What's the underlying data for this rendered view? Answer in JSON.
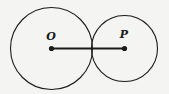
{
  "diagram": {
    "background": "#f4f4f2",
    "stroke_color": "#1a1a1a",
    "circles": [
      {
        "name": "circle-O",
        "cx": 51.5,
        "cy": 48.5,
        "r": 41
      },
      {
        "name": "circle-P",
        "cx": 124.5,
        "cy": 48.5,
        "r": 33
      }
    ],
    "points": [
      {
        "name": "O",
        "label": "O",
        "x": 51.5,
        "y": 48.5
      },
      {
        "name": "P",
        "label": "P",
        "x": 124.5,
        "y": 48.5
      }
    ],
    "segment": {
      "from": "O",
      "to": "P"
    }
  }
}
